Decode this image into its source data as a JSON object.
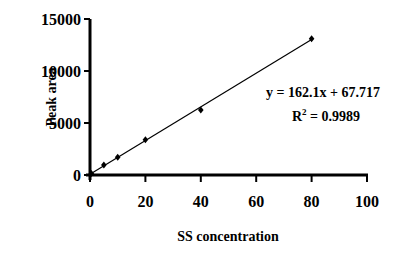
{
  "chart_data": {
    "type": "scatter",
    "title": "",
    "xlabel": "SS concentration",
    "ylabel": "Peak area",
    "xlim": [
      0,
      100
    ],
    "ylim": [
      0,
      15000
    ],
    "x_ticks": [
      0,
      20,
      40,
      60,
      80,
      100
    ],
    "y_ticks": [
      0,
      5000,
      10000,
      15000
    ],
    "grid": false,
    "legend": null,
    "series": [
      {
        "name": "Peak area",
        "marker": "diamond",
        "x": [
          0.5,
          5,
          10,
          20,
          40,
          80
        ],
        "y": [
          150,
          950,
          1700,
          3400,
          6250,
          13100
        ]
      }
    ],
    "trendline": {
      "type": "linear",
      "slope": 162.1,
      "intercept": 67.717,
      "r_squared": 0.9989
    },
    "annotations": {
      "equation": "y = 162.1x + 67.717",
      "r2_prefix": "R",
      "r2_sup": "2",
      "r2_value": " = 0.9989"
    }
  }
}
